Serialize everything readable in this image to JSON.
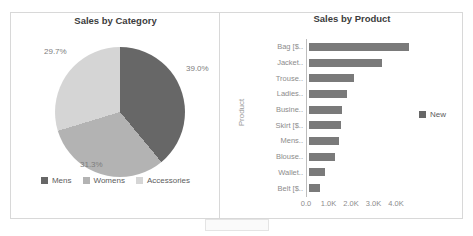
{
  "pie": {
    "title": "Sales by Category",
    "legend": [
      {
        "label": "Mens",
        "color": "#676767"
      },
      {
        "label": "Womens",
        "color": "#b3b3b3"
      },
      {
        "label": "Accessories",
        "color": "#d5d5d5"
      }
    ],
    "slices": [
      {
        "label": "Mens",
        "value": 39.0,
        "display": "39.0%"
      },
      {
        "label": "Womens",
        "value": 31.3,
        "display": "31.3%"
      },
      {
        "label": "Accessories",
        "value": 29.7,
        "display": "29.7%"
      }
    ]
  },
  "bar": {
    "title": "Sales by Product",
    "ylabel": "Product",
    "legend_label": "New",
    "bar_color": "#7a7a7a",
    "legend_color": "#676767",
    "categories": [
      "Bag [$..",
      "Jacket..",
      "Trouse..",
      "Ladies..",
      "Busine..",
      "Skirt [$..",
      "Mens..",
      "Blouse..",
      "Wallet..",
      "Belt [$.."
    ],
    "values": [
      4450,
      3250,
      2000,
      1700,
      1450,
      1400,
      1350,
      1150,
      700,
      500
    ],
    "x_ticks": [
      "0.0",
      "1.0K",
      "2.0K",
      "3.0K",
      "4.0K"
    ]
  },
  "chart_data": [
    {
      "type": "pie",
      "title": "Sales by Category",
      "labels": [
        "Mens",
        "Womens",
        "Accessories"
      ],
      "values": [
        39.0,
        31.3,
        29.7
      ],
      "unit": "percent",
      "colors": [
        "#676767",
        "#b3b3b3",
        "#d5d5d5"
      ],
      "start_angle": "top, clockwise",
      "legend_position": "bottom",
      "annotations": [
        "39.0%",
        "31.3%",
        "29.7%"
      ]
    },
    {
      "type": "bar",
      "orientation": "horizontal",
      "title": "Sales by Product",
      "xlabel": "",
      "ylabel": "Product",
      "categories": [
        "Bag [$..",
        "Jacket..",
        "Trouse..",
        "Ladies..",
        "Busine..",
        "Skirt [$..",
        "Mens..",
        "Blouse..",
        "Wallet..",
        "Belt [$.."
      ],
      "values": [
        4450,
        3250,
        2000,
        1700,
        1450,
        1400,
        1350,
        1150,
        700,
        500
      ],
      "xlim": [
        0,
        4500
      ],
      "x_tick_labels": [
        "0.0",
        "1.0K",
        "2.0K",
        "3.0K",
        "4.0K"
      ],
      "grid": false,
      "legend": [
        "New"
      ],
      "legend_position": "right"
    }
  ]
}
